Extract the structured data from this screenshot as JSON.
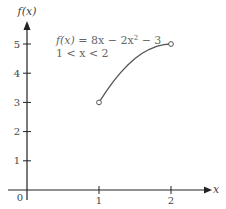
{
  "chart_data": {
    "type": "line",
    "title": "",
    "xlabel": "x",
    "ylabel": "f(x)",
    "xlim": [
      0,
      2.55
    ],
    "ylim": [
      0,
      5.8
    ],
    "x_ticks": [
      0,
      1,
      2
    ],
    "x_tick_labels": [
      "0",
      "1",
      "2"
    ],
    "y_ticks": [
      1,
      2,
      3,
      4,
      5
    ],
    "y_tick_labels": [
      "1",
      "2",
      "3",
      "4",
      "5"
    ],
    "grid": false,
    "legend": null,
    "annotations": [
      {
        "text": "f(x) = 8x − 2x² − 3",
        "line": 1
      },
      {
        "text": "1 < x < 2",
        "line": 2
      }
    ],
    "series": [
      {
        "name": "f(x) = 8x − 2x² − 3",
        "function": "8x - 2x^2 - 3",
        "domain": [
          1,
          2
        ],
        "endpoints": [
          {
            "x": 1,
            "y": 3,
            "open": true
          },
          {
            "x": 2,
            "y": 5,
            "open": true
          }
        ],
        "x": [
          1.0,
          1.1,
          1.2,
          1.3,
          1.4,
          1.5,
          1.6,
          1.7,
          1.8,
          1.9,
          2.0
        ],
        "values": [
          3.0,
          3.38,
          3.72,
          4.02,
          4.28,
          4.5,
          4.68,
          4.82,
          4.92,
          4.98,
          5.0
        ]
      }
    ]
  },
  "labels": {
    "y_axis": "f(x)",
    "x_axis": "x",
    "origin": "0",
    "formula_fx": "f(x)",
    "formula_rest": " = 8x − 2x",
    "formula_exp": "2",
    "formula_tail": " − 3",
    "domain": "1 < x < 2"
  },
  "colors": {
    "axis": "#222222",
    "curve": "#555555",
    "text": "#444444"
  }
}
